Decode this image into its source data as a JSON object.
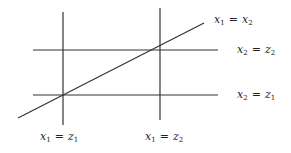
{
  "diagram": {
    "type": "line-arrangement",
    "line_color": "#333333",
    "lines": [
      {
        "id": "v-left",
        "x1": 63,
        "y1": 12,
        "x2": 63,
        "y2": 125,
        "label_index": 3
      },
      {
        "id": "v-right",
        "x1": 160,
        "y1": 8,
        "x2": 160,
        "y2": 120,
        "label_index": 4
      },
      {
        "id": "h-top",
        "x1": 33,
        "y1": 50,
        "x2": 218,
        "y2": 50,
        "label_index": 1
      },
      {
        "id": "h-bottom",
        "x1": 33,
        "y1": 95,
        "x2": 218,
        "y2": 95,
        "label_index": 2
      },
      {
        "id": "diagonal",
        "x1": 18,
        "y1": 118,
        "x2": 204,
        "y2": 23,
        "label_index": 0
      }
    ],
    "labels": [
      {
        "lhs_var": "x",
        "lhs_sub": "1",
        "op": "=",
        "rhs_var": "x",
        "rhs_sub": "2",
        "text": "x1 = x2"
      },
      {
        "lhs_var": "x",
        "lhs_sub": "2",
        "op": "=",
        "rhs_var": "z",
        "rhs_sub": "2",
        "text": "x2 = z2"
      },
      {
        "lhs_var": "x",
        "lhs_sub": "2",
        "op": "=",
        "rhs_var": "z",
        "rhs_sub": "1",
        "text": "x2 = z1"
      },
      {
        "lhs_var": "x",
        "lhs_sub": "1",
        "op": "=",
        "rhs_var": "z",
        "rhs_sub": "1",
        "text": "x1 = z1"
      },
      {
        "lhs_var": "x",
        "lhs_sub": "1",
        "op": "=",
        "rhs_var": "z",
        "rhs_sub": "2",
        "text": "x1 = z2"
      }
    ]
  }
}
